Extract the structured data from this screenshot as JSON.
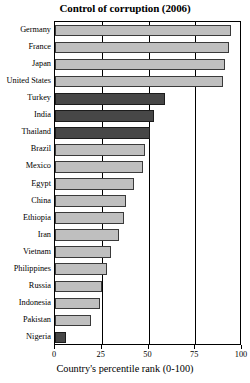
{
  "chart_data": {
    "type": "bar",
    "orientation": "horizontal",
    "title": "Control of corruption (2006)",
    "xlabel": "Country's percentile rank (0-100)",
    "ylabel": "",
    "xlim": [
      0,
      100
    ],
    "xticks": [
      0,
      25,
      50,
      75,
      100
    ],
    "xticklabels": [
      "0",
      "25",
      "50",
      "75",
      "100"
    ],
    "grid": "vertical gridlines at each x tick",
    "legend": "none",
    "categories": [
      "Germany",
      "France",
      "Japan",
      "United States",
      "Turkey",
      "India",
      "Thailand",
      "Brazil",
      "Mexico",
      "Egypt",
      "China",
      "Ethiopia",
      "Iran",
      "Vietnam",
      "Philippines",
      "Russia",
      "Indonesia",
      "Pakistan",
      "Nigeria"
    ],
    "values": [
      94,
      93,
      91,
      90,
      59,
      53,
      51,
      48,
      47,
      42,
      38,
      37,
      34,
      30,
      28,
      25,
      24,
      19,
      6
    ],
    "bar_styles": [
      "light",
      "light",
      "light",
      "light",
      "dark",
      "dark",
      "dark",
      "light",
      "light",
      "light",
      "light",
      "light",
      "light",
      "light",
      "light",
      "light",
      "light",
      "light",
      "dark"
    ],
    "colors": {
      "light_bar": "#bfbfbf",
      "dark_bar": "#474747",
      "bar_edge": "#3a3a3a",
      "axis": "#000000",
      "background": "#ffffff",
      "text": "#000000"
    }
  }
}
